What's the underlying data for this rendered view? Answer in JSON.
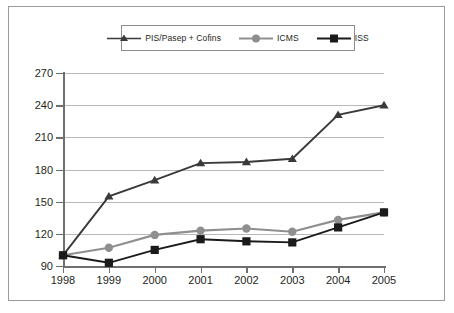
{
  "chart_data": {
    "type": "line",
    "title": "",
    "subtitle": "",
    "xlabel": "",
    "ylabel": "",
    "categories": [
      "1998",
      "1999",
      "2000",
      "2001",
      "2002",
      "2003",
      "2004",
      "2005"
    ],
    "x": [
      1998,
      1999,
      2000,
      2001,
      2002,
      2003,
      2004,
      2005
    ],
    "ylim": [
      90,
      270
    ],
    "yticks": [
      90,
      120,
      150,
      180,
      210,
      240,
      270
    ],
    "ytick_labels": [
      "90",
      "120",
      "150",
      "180",
      "210",
      "240",
      "270"
    ],
    "grid": true,
    "legend_position": "top-center",
    "series": [
      {
        "name": "PIS/Pasep + Cofins",
        "marker": "triangle",
        "color": "#3a3a3a",
        "values": [
          100,
          155,
          170,
          186,
          187,
          190,
          231,
          240
        ]
      },
      {
        "name": "ICMS",
        "marker": "circle",
        "color": "#8f8f8f",
        "values": [
          100,
          107,
          119,
          123,
          125,
          122,
          133,
          140
        ]
      },
      {
        "name": "ISS",
        "marker": "square",
        "color": "#1a1a1a",
        "values": [
          100,
          93,
          105,
          115,
          113,
          112,
          126,
          140
        ]
      }
    ]
  },
  "legend": {
    "items": [
      {
        "label": "PIS/Pasep + Cofins"
      },
      {
        "label": "ICMS"
      },
      {
        "label": "ISS"
      }
    ]
  },
  "colors": {
    "series_1": "#3a3a3a",
    "series_2": "#8f8f8f",
    "series_3": "#1a1a1a",
    "grid": "#b9b9b9",
    "axis": "#6f6f6f",
    "frame": "#9b9b9b",
    "text": "#231f20",
    "background": "#ffffff"
  }
}
